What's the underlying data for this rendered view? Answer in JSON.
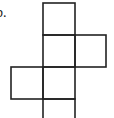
{
  "label": "b.",
  "diagram": {
    "type": "cube-net",
    "stroke_color": "#222222",
    "squares": [
      {
        "name": "top",
        "x": 43,
        "y": 3,
        "w": 32,
        "h": 32
      },
      {
        "name": "middle-upper",
        "x": 43,
        "y": 35,
        "w": 32,
        "h": 32
      },
      {
        "name": "right",
        "x": 75,
        "y": 35,
        "w": 31,
        "h": 32
      },
      {
        "name": "left",
        "x": 11,
        "y": 67,
        "w": 32,
        "h": 32
      },
      {
        "name": "middle-lower",
        "x": 43,
        "y": 67,
        "w": 32,
        "h": 32
      },
      {
        "name": "bottom",
        "x": 43,
        "y": 99,
        "w": 32,
        "h": 32
      }
    ]
  }
}
